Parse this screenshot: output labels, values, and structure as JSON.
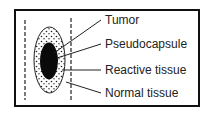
{
  "diagram": {
    "title": "",
    "labels": [
      {
        "text": "Tumor"
      },
      {
        "text": "Pseudocapsule"
      },
      {
        "text": "Reactive tissue"
      },
      {
        "text": "Normal tissue"
      }
    ]
  }
}
